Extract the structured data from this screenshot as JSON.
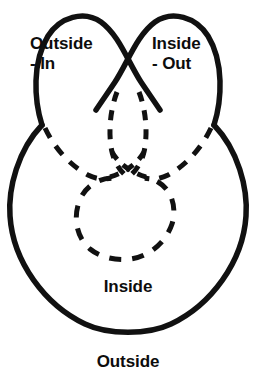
{
  "figure": {
    "background_color": "#ffffff",
    "stroke_color": "#111111",
    "solid_stroke_width": 5,
    "dashed_stroke_width": 5,
    "dash_pattern": "10 9"
  },
  "labels": {
    "outside_in": {
      "line1": "Outside",
      "line2": "- In"
    },
    "inside_out": {
      "line1": "Inside",
      "line2": "- Out"
    },
    "inside": "Inside",
    "outside": "Outside"
  },
  "regions": [
    {
      "name": "left-lobe",
      "label": "Outside - In",
      "stroke": "solid"
    },
    {
      "name": "right-lobe",
      "label": "Inside - Out",
      "stroke": "solid"
    },
    {
      "name": "body-circle",
      "label": "Inside",
      "stroke": "solid"
    },
    {
      "name": "inner-circle",
      "label": "",
      "stroke": "dashed"
    },
    {
      "name": "ambient-space",
      "label": "Outside",
      "stroke": "none"
    }
  ]
}
